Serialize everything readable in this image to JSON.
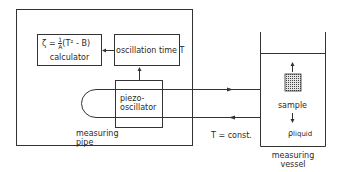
{
  "diagram": {
    "calculator": {
      "formula_lhs": "ζ",
      "formula_eq": "=",
      "formula_frac_num": "1",
      "formula_frac_den": "A",
      "formula_rhs": "(T² - B)",
      "label": "calculator"
    },
    "oscillation_time": {
      "label": "oscillation time T"
    },
    "piezo_oscillator": {
      "line1": "piezo-",
      "line2": "oscillator"
    },
    "measuring_pipe": {
      "line1": "measuring",
      "line2": "pipe"
    },
    "temperature_note": "T = const.",
    "measuring_vessel": {
      "sample_label": "sample",
      "density_symbol": "ρ",
      "density_subscript": "liquid",
      "line1": "measuring",
      "line2": "vessel"
    },
    "colors": {
      "line": "#333333",
      "sample_fill": "#555555",
      "background": "#ffffff"
    }
  }
}
